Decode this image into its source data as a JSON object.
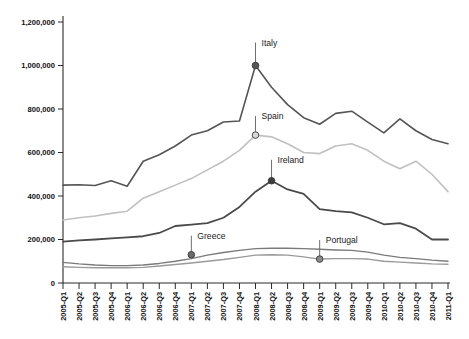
{
  "chart_data": {
    "type": "line",
    "title": "",
    "xlabel": "",
    "ylabel": "",
    "grid": false,
    "legend_position": "inline-annotations",
    "ylim": [
      0,
      1200000
    ],
    "ytick_labels": [
      "1,200,000",
      "1,000,000",
      "800,000",
      "600,000",
      "400,000",
      "200,000",
      "0"
    ],
    "ytick_values": [
      1200000,
      1000000,
      800000,
      600000,
      400000,
      200000,
      0
    ],
    "categories": [
      "2005-Q1",
      "2005-Q2",
      "2005-Q3",
      "2005-Q4",
      "2006-Q1",
      "2006-Q2",
      "2006-Q3",
      "2006-Q4",
      "2007-Q1",
      "2007-Q2",
      "2007-Q3",
      "2007-Q4",
      "2008-Q1",
      "2008-Q2",
      "2008-Q3",
      "2008-Q4",
      "2009-Q1",
      "2009-Q2",
      "2009-Q3",
      "2009-Q4",
      "2010-Q1",
      "2010-Q2",
      "2010-Q3",
      "2010-Q4",
      "2011-Q1"
    ],
    "series": [
      {
        "name": "Italy",
        "color": "#555555",
        "width": 1.6,
        "marker_index": 12,
        "marker_value": 1000000,
        "marker_fill": "#555555",
        "label_dx": 6,
        "label_dy": -26,
        "values": [
          450000,
          452000,
          448000,
          470000,
          445000,
          560000,
          590000,
          630000,
          680000,
          700000,
          740000,
          745000,
          1000000,
          900000,
          820000,
          760000,
          730000,
          780000,
          790000,
          740000,
          690000,
          755000,
          700000,
          660000,
          640000
        ]
      },
      {
        "name": "Spain",
        "color": "#c0c0c0",
        "width": 1.6,
        "marker_index": 12,
        "marker_value": 680000,
        "marker_fill": "#d8d8d8",
        "label_dx": 6,
        "label_dy": -22,
        "values": [
          290000,
          300000,
          308000,
          320000,
          330000,
          390000,
          420000,
          450000,
          480000,
          520000,
          560000,
          610000,
          680000,
          672000,
          640000,
          600000,
          595000,
          630000,
          640000,
          610000,
          560000,
          525000,
          560000,
          500000,
          420000
        ]
      },
      {
        "name": "Ireland",
        "color": "#4a4a4a",
        "width": 1.8,
        "marker_index": 13,
        "marker_value": 470000,
        "marker_fill": "#3d3d3d",
        "label_dx": 6,
        "label_dy": -24,
        "values": [
          190000,
          196000,
          200000,
          205000,
          210000,
          215000,
          230000,
          262000,
          268000,
          275000,
          300000,
          350000,
          420000,
          470000,
          430000,
          410000,
          340000,
          330000,
          325000,
          300000,
          270000,
          275000,
          250000,
          200000,
          200000
        ]
      },
      {
        "name": "Greece",
        "color": "#7a7a7a",
        "width": 1.4,
        "marker_index": 8,
        "marker_value": 130000,
        "marker_fill": "#6a6a6a",
        "label_dx": 6,
        "label_dy": -22,
        "values": [
          95000,
          88000,
          83000,
          80000,
          80000,
          83000,
          90000,
          100000,
          112000,
          128000,
          140000,
          150000,
          158000,
          160000,
          160000,
          158000,
          155000,
          152000,
          150000,
          142000,
          128000,
          118000,
          112000,
          105000,
          100000
        ]
      },
      {
        "name": "Portugal",
        "color": "#9a9a9a",
        "width": 1.4,
        "marker_index": 16,
        "marker_value": 110000,
        "marker_fill": "#8a8a8a",
        "label_dx": 6,
        "label_dy": -22,
        "values": [
          75000,
          72000,
          70000,
          70000,
          70000,
          72000,
          78000,
          85000,
          92000,
          100000,
          108000,
          118000,
          128000,
          130000,
          128000,
          120000,
          110000,
          112000,
          112000,
          110000,
          100000,
          96000,
          92000,
          88000,
          86000
        ]
      }
    ]
  },
  "axis": {
    "origin_label": "0"
  }
}
